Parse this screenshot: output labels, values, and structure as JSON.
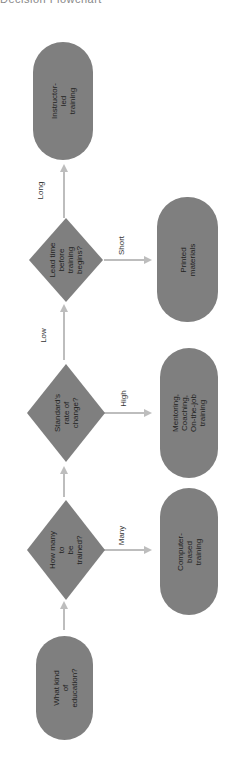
{
  "caption": "Decision Flowchart",
  "colors": {
    "node_fill": "#7f7f7f",
    "arrow": "#bdbdbd",
    "text": "#1f1f1f",
    "background": "#ffffff"
  },
  "orientation": "rotated 90° counter-clockwise; flow reads bottom-to-top",
  "nodes": {
    "start": "What kind of\neducation?",
    "q_how_many": "How many to\nbe trained?",
    "q_rate": "Standard's\nrate of\nchange?",
    "q_lead_time": "Lead time\nbefore training\nbegins?",
    "r_instructor": "Instructor-led\ntraining",
    "r_printed": "Printed\nmaterials",
    "r_mentoring": "Mentoring, Coaching,\nOn-the-job training",
    "r_cbt": "Computer-\nbased training"
  },
  "edges": {
    "many": "Many",
    "high": "High",
    "low": "Low",
    "short": "Short",
    "long": "Long"
  }
}
